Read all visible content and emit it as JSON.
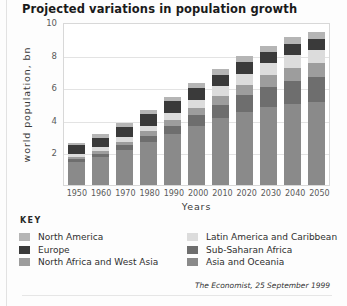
{
  "title": "Projected variations in population growth",
  "key_label": "KEY",
  "source": "The Economist, 25 September 1999",
  "chart_data": {
    "type": "bar",
    "stacked": true,
    "title": "Projected variations in population growth",
    "xlabel": "Years",
    "ylabel": "world population, bn",
    "categories": [
      "1950",
      "1960",
      "1970",
      "1980",
      "1990",
      "2000",
      "2010",
      "2020",
      "2030",
      "2040",
      "2050"
    ],
    "ylim": [
      0,
      10
    ],
    "yticks": [
      2,
      4,
      6,
      8,
      10
    ],
    "grid": true,
    "legend_position": "bottom",
    "series": [
      {
        "name": "Asia and Oceania",
        "color": "#8a8a8a",
        "values": [
          1.4,
          1.7,
          2.15,
          2.65,
          3.15,
          3.65,
          4.1,
          4.5,
          4.8,
          5.0,
          5.1
        ]
      },
      {
        "name": "Sub-Saharan Africa",
        "color": "#6e6e6e",
        "values": [
          0.18,
          0.22,
          0.28,
          0.36,
          0.48,
          0.62,
          0.8,
          1.0,
          1.2,
          1.4,
          1.55
        ]
      },
      {
        "name": "North Africa and West Asia",
        "color": "#9d9d9d",
        "values": [
          0.14,
          0.17,
          0.22,
          0.28,
          0.36,
          0.45,
          0.55,
          0.65,
          0.73,
          0.8,
          0.85
        ]
      },
      {
        "name": "Latin America and Caribbean",
        "color": "#dcdcdc",
        "values": [
          0.17,
          0.22,
          0.29,
          0.36,
          0.44,
          0.52,
          0.6,
          0.68,
          0.73,
          0.77,
          0.8
        ]
      },
      {
        "name": "Europe",
        "color": "#3a3a3a",
        "values": [
          0.55,
          0.6,
          0.65,
          0.69,
          0.72,
          0.73,
          0.73,
          0.72,
          0.7,
          0.67,
          0.64
        ]
      },
      {
        "name": "North America",
        "color": "#b5b5b5",
        "values": [
          0.17,
          0.2,
          0.23,
          0.25,
          0.28,
          0.31,
          0.34,
          0.37,
          0.4,
          0.42,
          0.44
        ]
      }
    ],
    "totals": [
      2.61,
      3.11,
      3.82,
      4.59,
      5.43,
      6.28,
      7.12,
      7.92,
      8.56,
      9.06,
      9.38
    ]
  },
  "legend_left": [
    {
      "label": "North America",
      "color": "#b5b5b5"
    },
    {
      "label": "Europe",
      "color": "#3a3a3a"
    },
    {
      "label": "North Africa and West Asia",
      "color": "#9d9d9d"
    }
  ],
  "legend_right": [
    {
      "label": "Latin America and Caribbean",
      "color": "#dcdcdc"
    },
    {
      "label": "Sub-Saharan Africa",
      "color": "#6e6e6e"
    },
    {
      "label": "Asia and Oceania",
      "color": "#8a8a8a"
    }
  ]
}
